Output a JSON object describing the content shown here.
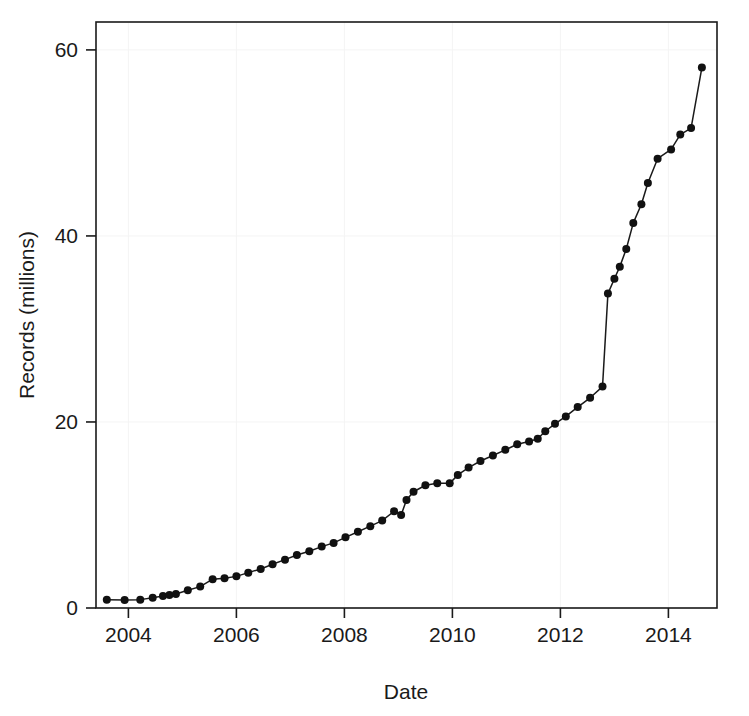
{
  "chart_data": {
    "type": "line",
    "title": "",
    "xlabel": "Date",
    "ylabel": "Records (millions)",
    "xlim": [
      2003.4,
      2014.9
    ],
    "ylim": [
      0,
      63
    ],
    "grid": true,
    "grid_style": "very-faint-gray",
    "legend": "none",
    "marker": "filled-circle",
    "line_color": "#1a1a1a",
    "marker_color": "#111111",
    "xticks": [
      2004,
      2006,
      2008,
      2010,
      2012,
      2014
    ],
    "xtick_labels": [
      "2004",
      "2006",
      "2008",
      "2010",
      "2012",
      "2014"
    ],
    "yticks": [
      0,
      20,
      40,
      60
    ],
    "ytick_labels": [
      "0",
      "20",
      "40",
      "60"
    ],
    "series": [
      {
        "name": "Records",
        "x": [
          2003.6,
          2003.93,
          2004.22,
          2004.45,
          2004.64,
          2004.76,
          2004.88,
          2005.1,
          2005.33,
          2005.56,
          2005.78,
          2006.0,
          2006.22,
          2006.45,
          2006.67,
          2006.9,
          2007.12,
          2007.35,
          2007.58,
          2007.8,
          2008.02,
          2008.25,
          2008.48,
          2008.7,
          2008.92,
          2009.05,
          2009.15,
          2009.28,
          2009.5,
          2009.72,
          2009.95,
          2010.1,
          2010.3,
          2010.52,
          2010.75,
          2010.98,
          2011.2,
          2011.42,
          2011.58,
          2011.72,
          2011.9,
          2012.1,
          2012.32,
          2012.55,
          2012.78,
          2012.88,
          2013.0,
          2013.1,
          2013.22,
          2013.35,
          2013.5,
          2013.62,
          2013.8,
          2014.05,
          2014.22,
          2014.42,
          2014.62
        ],
        "y": [
          0.9,
          0.85,
          0.9,
          1.1,
          1.3,
          1.4,
          1.5,
          1.9,
          2.3,
          3.1,
          3.2,
          3.4,
          3.8,
          4.2,
          4.7,
          5.2,
          5.7,
          6.1,
          6.6,
          7.0,
          7.6,
          8.2,
          8.8,
          9.4,
          10.4,
          10.0,
          11.6,
          12.5,
          13.2,
          13.4,
          13.4,
          14.3,
          15.1,
          15.8,
          16.4,
          17.0,
          17.6,
          17.9,
          18.2,
          19.0,
          19.8,
          20.6,
          21.6,
          22.6,
          23.8,
          33.8,
          35.4,
          36.7,
          38.6,
          41.4,
          43.4,
          45.7,
          48.3,
          49.3,
          50.9,
          51.6,
          58.1
        ]
      }
    ],
    "annotations": [
      "Sharp near-vertical jump from ~23.8 to ~33.8 million records at the end of 2012",
      "Brief plateau / slight dip around 2009 and again around 2010"
    ]
  }
}
